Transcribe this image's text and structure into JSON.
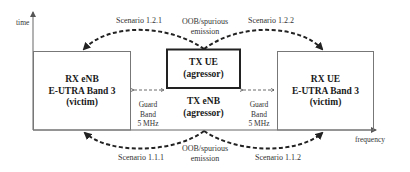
{
  "axes": {
    "y_label": "time",
    "x_label": "frequency"
  },
  "boxes": {
    "rx_enb": {
      "line1": "RX eNB",
      "line2": "E-UTRA Band 3",
      "line3": "(victim)"
    },
    "tx_ue": {
      "line1": "TX UE",
      "line2": "(agressor)"
    },
    "tx_enb": {
      "line1": "TX eNB",
      "line2": "(agressor)"
    },
    "rx_ue": {
      "line1": "RX UE",
      "line2": "E-UTRA Band 3",
      "line3": "(victim)"
    }
  },
  "guard_bands": [
    {
      "line1": "Guard",
      "line2": "Band",
      "line3": "5 MHz"
    },
    {
      "line1": "Guard",
      "line2": "Band",
      "line3": "5 MHz"
    }
  ],
  "scenarios": {
    "top_left": "Scenario 1.2.1",
    "top_right": "Scenario 1.2.2",
    "bottom_left": "Scenario 1.1.1",
    "bottom_right": "Scenario 1.1.2"
  },
  "emission": {
    "top": {
      "line1": "OOB/spurious",
      "line2": "emission"
    },
    "bottom": {
      "line1": "OOB/spurious",
      "line2": "emission"
    }
  },
  "colors": {
    "line": "#555555",
    "thick_box": "#222222",
    "arrow": "#222222"
  }
}
